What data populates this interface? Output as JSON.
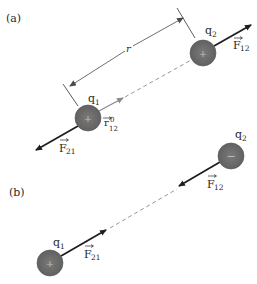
{
  "panels": [
    {
      "label": "(a)",
      "charges": [
        {
          "name": "q1",
          "label": "q",
          "sub": "1",
          "sign": "+",
          "cx": 88,
          "cy": 118
        },
        {
          "name": "q2",
          "label": "q",
          "sub": "2",
          "sign": "+",
          "cx": 203,
          "cy": 53
        }
      ],
      "forces": [
        {
          "name": "F12",
          "label": "F",
          "sub": "12"
        },
        {
          "name": "F21",
          "label": "F",
          "sub": "21"
        }
      ],
      "unit_vector": {
        "label": "r",
        "sub": "12",
        "sup": "0"
      },
      "distance_label": "r"
    },
    {
      "label": "(b)",
      "charges": [
        {
          "name": "q1",
          "label": "q",
          "sub": "1",
          "sign": "+",
          "cx": 50,
          "cy": 263
        },
        {
          "name": "q2",
          "label": "q",
          "sub": "2",
          "sign": "−",
          "cx": 231,
          "cy": 156
        }
      ],
      "forces": [
        {
          "name": "F12",
          "label": "F",
          "sub": "12"
        },
        {
          "name": "F21",
          "label": "F",
          "sub": "21"
        }
      ]
    }
  ],
  "colors": {
    "charge_fill": "#6b6b6b",
    "charge_stroke": "#555555",
    "force_arrow": "#1e1e1e",
    "unit_arrow": "#8a8a8a",
    "dashed": "#8a8a8a",
    "dimension": "#4a4a4a"
  }
}
